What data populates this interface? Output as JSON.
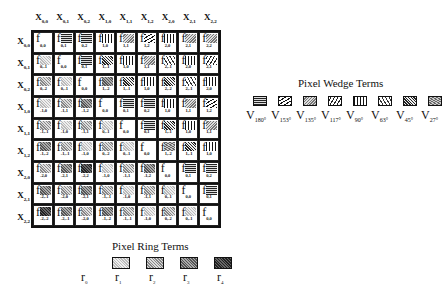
{
  "columns": [
    "X_{0,0}",
    "X_{0,1}",
    "X_{0,2}",
    "X_{1,0}",
    "X_{1,1}",
    "X_{1,2}",
    "X_{2,0}",
    "X_{2,1}",
    "X_{2,2}"
  ],
  "column_headers": [
    {
      "base": "X",
      "sub": "0,0"
    },
    {
      "base": "X",
      "sub": "0,1"
    },
    {
      "base": "X",
      "sub": "0,2"
    },
    {
      "base": "X",
      "sub": "1,0"
    },
    {
      "base": "X",
      "sub": "1,1"
    },
    {
      "base": "X",
      "sub": "1,2"
    },
    {
      "base": "X",
      "sub": "2,0"
    },
    {
      "base": "X",
      "sub": "2,1"
    },
    {
      "base": "X",
      "sub": "2,2"
    }
  ],
  "row_headers": [
    {
      "base": "X",
      "sub": "0,0"
    },
    {
      "base": "X",
      "sub": "0,1"
    },
    {
      "base": "X",
      "sub": "0,2"
    },
    {
      "base": "X",
      "sub": "1,0"
    },
    {
      "base": "X",
      "sub": "1,1"
    },
    {
      "base": "X",
      "sub": "1,2"
    },
    {
      "base": "X",
      "sub": "2,0"
    },
    {
      "base": "X",
      "sub": "2,1"
    },
    {
      "base": "X",
      "sub": "2,2"
    }
  ],
  "matrix": [
    [
      {
        "f": "0,0",
        "p": "none"
      },
      {
        "f": "0,1",
        "p": "w180"
      },
      {
        "f": "0,2",
        "p": "w180"
      },
      {
        "f": "1,0",
        "p": "w90"
      },
      {
        "f": "1,1",
        "p": "w135"
      },
      {
        "f": "1,2",
        "p": "w153"
      },
      {
        "f": "2,0",
        "p": "w90"
      },
      {
        "f": "2,1",
        "p": "w135"
      },
      {
        "f": "2,2",
        "p": "w135"
      }
    ],
    [
      {
        "f": "0,-1",
        "p": "r1"
      },
      {
        "f": "0,0",
        "p": "none"
      },
      {
        "f": "0,1",
        "p": "w180"
      },
      {
        "f": "1,-1",
        "p": "w45"
      },
      {
        "f": "1,0",
        "p": "w90"
      },
      {
        "f": "1,1",
        "p": "w135"
      },
      {
        "f": "2,-1",
        "p": "w63"
      },
      {
        "f": "2,0",
        "p": "w90"
      },
      {
        "f": "2,1",
        "p": "w117"
      }
    ],
    [
      {
        "f": "0,-2",
        "p": "r2"
      },
      {
        "f": "0,-1",
        "p": "r1"
      },
      {
        "f": "0,0",
        "p": "none"
      },
      {
        "f": "1,-2",
        "p": "r3"
      },
      {
        "f": "1,-1",
        "p": "w45"
      },
      {
        "f": "1,0",
        "p": "w90"
      },
      {
        "f": "2,-2",
        "p": "w45"
      },
      {
        "f": "2,-1",
        "p": "w63"
      },
      {
        "f": "2,0",
        "p": "w90"
      }
    ],
    [
      {
        "f": "-1,0",
        "p": "r1"
      },
      {
        "f": "-1,1",
        "p": "r2"
      },
      {
        "f": "-1,2",
        "p": "r3"
      },
      {
        "f": "0,0",
        "p": "none"
      },
      {
        "f": "0,1",
        "p": "w180"
      },
      {
        "f": "0,2",
        "p": "w180"
      },
      {
        "f": "1,0",
        "p": "w90"
      },
      {
        "f": "1,1",
        "p": "w135"
      },
      {
        "f": "1,2",
        "p": "w153"
      }
    ],
    [
      {
        "f": "-1,-1",
        "p": "r2"
      },
      {
        "f": "-1,0",
        "p": "r1"
      },
      {
        "f": "-1,1",
        "p": "r2"
      },
      {
        "f": "0,-1",
        "p": "r1"
      },
      {
        "f": "0,0",
        "p": "none"
      },
      {
        "f": "0,1",
        "p": "w180"
      },
      {
        "f": "1,-1",
        "p": "w45"
      },
      {
        "f": "1,0",
        "p": "w90"
      },
      {
        "f": "1,1",
        "p": "w135"
      }
    ],
    [
      {
        "f": "-1,-2",
        "p": "r3"
      },
      {
        "f": "-1,-1",
        "p": "r2"
      },
      {
        "f": "-1,0",
        "p": "r1"
      },
      {
        "f": "0,-2",
        "p": "r2"
      },
      {
        "f": "0,-1",
        "p": "r1"
      },
      {
        "f": "0,0",
        "p": "none"
      },
      {
        "f": "1,-2",
        "p": "w27"
      },
      {
        "f": "1,-1",
        "p": "w45"
      },
      {
        "f": "1,0",
        "p": "w90"
      }
    ],
    [
      {
        "f": "-2,0",
        "p": "r2"
      },
      {
        "f": "-2,1",
        "p": "r3"
      },
      {
        "f": "-2,2",
        "p": "r4"
      },
      {
        "f": "-1,0",
        "p": "r1"
      },
      {
        "f": "-1,1",
        "p": "r2"
      },
      {
        "f": "-1,2",
        "p": "r3"
      },
      {
        "f": "0,0",
        "p": "none"
      },
      {
        "f": "0,1",
        "p": "w180"
      },
      {
        "f": "0,2",
        "p": "w180"
      }
    ],
    [
      {
        "f": "-2,-1",
        "p": "r3"
      },
      {
        "f": "-2,0",
        "p": "r2"
      },
      {
        "f": "-2,1",
        "p": "r3"
      },
      {
        "f": "-1,-1",
        "p": "r2"
      },
      {
        "f": "-1,0",
        "p": "r1"
      },
      {
        "f": "-1,1",
        "p": "r2"
      },
      {
        "f": "0,-1",
        "p": "r1"
      },
      {
        "f": "0,0",
        "p": "none"
      },
      {
        "f": "0,1",
        "p": "w180"
      }
    ],
    [
      {
        "f": "-2,-2",
        "p": "r4"
      },
      {
        "f": "-2,-1",
        "p": "r3"
      },
      {
        "f": "-2,0",
        "p": "r2"
      },
      {
        "f": "-1,-2",
        "p": "r3"
      },
      {
        "f": "-1,-1",
        "p": "r2"
      },
      {
        "f": "-1,0",
        "p": "r1"
      },
      {
        "f": "0,-2",
        "p": "r2"
      },
      {
        "f": "0,-1",
        "p": "r1"
      },
      {
        "f": "0,0",
        "p": "none"
      }
    ]
  ],
  "cell_symbol": "f",
  "ring_legend": {
    "title": "Pixel Ring Terms",
    "items": [
      {
        "base": "r",
        "sub": "0",
        "p": "none"
      },
      {
        "base": "r",
        "sub": "1",
        "p": "r1"
      },
      {
        "base": "r",
        "sub": "2",
        "p": "r2"
      },
      {
        "base": "r",
        "sub": "3",
        "p": "r3"
      },
      {
        "base": "r",
        "sub": "4",
        "p": "r4"
      }
    ]
  },
  "wedge_legend": {
    "title": "Pixel Wedge Terms",
    "items": [
      {
        "base": "V",
        "sub": "180°",
        "p": "w180"
      },
      {
        "base": "V",
        "sub": "153°",
        "p": "w153"
      },
      {
        "base": "V",
        "sub": "135°",
        "p": "w135"
      },
      {
        "base": "V",
        "sub": "117°",
        "p": "w117"
      },
      {
        "base": "V",
        "sub": "90°",
        "p": "w90"
      },
      {
        "base": "V",
        "sub": "63°",
        "p": "w63"
      },
      {
        "base": "V",
        "sub": "45°",
        "p": "w45"
      },
      {
        "base": "V",
        "sub": "27°",
        "p": "w27"
      }
    ]
  }
}
